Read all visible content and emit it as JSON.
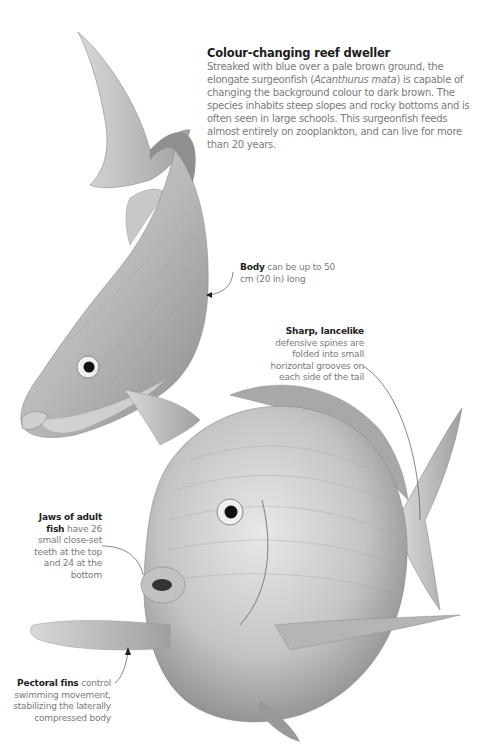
{
  "heading": "Colour-changing reef dweller",
  "intro": {
    "before_italic": "Streaked with blue over a pale brown ground, the elongate surgeonfish (",
    "italic": "Acanthurus mata",
    "after_italic": ") is capable of changing the background colour to dark brown. The species inhabits steep slopes and rocky bottoms and is often seen in large schools. This surgeonfish feeds almost entirely on zooplankton, and can live for more than 20 years."
  },
  "annotations": [
    {
      "id": "body",
      "bold": "Body",
      "text": " can be up to 50 cm (20 in) long"
    },
    {
      "id": "spines",
      "bold": "Sharp, lancelike",
      "text": " defensive spines are folded into small horizontal grooves on each side of the tail"
    },
    {
      "id": "jaws",
      "bold": "Jaws of adult fish",
      "text": " have 26 small close-set teeth at the top and 24 at the bottom"
    },
    {
      "id": "pectoral",
      "bold": "Pectoral fins",
      "text": " control swimming movement, stabilizing the laterally compressed body"
    }
  ],
  "colors": {
    "heading": "#1c1c1c",
    "body_text": "#7a7a7a",
    "fish_light": "#e6e6e6",
    "fish_mid": "#a8a8a8",
    "fish_dark": "#555555"
  }
}
